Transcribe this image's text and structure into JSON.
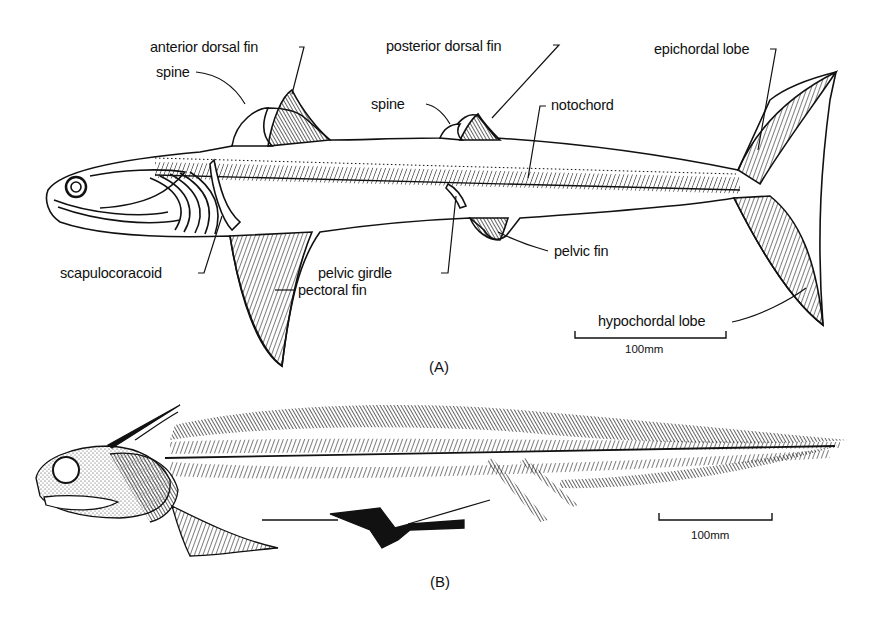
{
  "figure": {
    "panel_a": {
      "label": "(A)",
      "labels": {
        "anterior_dorsal_fin": "anterior dorsal fin",
        "posterior_dorsal_fin": "posterior dorsal fin",
        "spine_1": "spine",
        "spine_2": "spine",
        "notochord": "notochord",
        "epichordal_lobe": "epichordal lobe",
        "scapulocoracoid": "scapulocoracoid",
        "pelvic_girdle": "pelvic girdle",
        "pelvic_fin": "pelvic fin",
        "pectoral_fin": "pectoral fin",
        "hypochordal_lobe": "hypochordal lobe"
      },
      "scale_bar": "100mm"
    },
    "panel_b": {
      "label": "(B)",
      "scale_bar": "100mm"
    }
  }
}
